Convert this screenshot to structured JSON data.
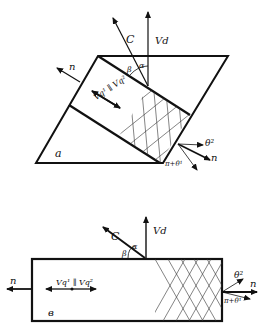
{
  "figure_a": {
    "panel_label": "a",
    "vector_c": "C",
    "vector_vd": "Vd",
    "normal_left": "n",
    "normal_right": "n",
    "angle_beta": "β",
    "angle_alpha": "α",
    "velocity_relation": "Vq¹ ∥ Vq²",
    "theta_top": "θ²",
    "theta_bottom": "π+θ¹"
  },
  "figure_b": {
    "panel_label": "в",
    "vector_c": "C",
    "vector_vd": "Vd",
    "normal_left": "n",
    "normal_right": "n",
    "angle_beta": "β",
    "angle_alpha": "α",
    "velocity_relation": "Vq¹ ∥ Vq²",
    "theta_top": "θ²",
    "theta_bottom": "π+θ¹"
  },
  "colors": {
    "ink": "#111111",
    "background": "#ffffff"
  }
}
